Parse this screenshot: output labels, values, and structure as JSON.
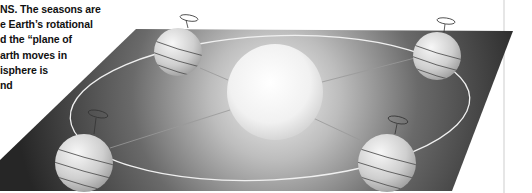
{
  "caption": {
    "lines": [
      "NS. The seasons are",
      "e Earth’s rotational",
      "d the “plane of",
      "arth moves in",
      "isphere is",
      "nd"
    ]
  },
  "figure": {
    "orbital_plane_color": "#2a2a2a",
    "sun_color": "#f4f4f4",
    "orbit_color": "#f0f0f0",
    "globe_color": "#d8d8d8",
    "globes": [
      {
        "position": "top-left",
        "cx": 178,
        "cy": 52,
        "r": 24
      },
      {
        "position": "top-right",
        "cx": 437,
        "cy": 56,
        "r": 24
      },
      {
        "position": "bottom-left",
        "cx": 84,
        "cy": 163,
        "r": 29
      },
      {
        "position": "bottom-right",
        "cx": 387,
        "cy": 163,
        "r": 29
      }
    ],
    "sun": {
      "cx": 275,
      "cy": 92,
      "r": 48
    }
  }
}
